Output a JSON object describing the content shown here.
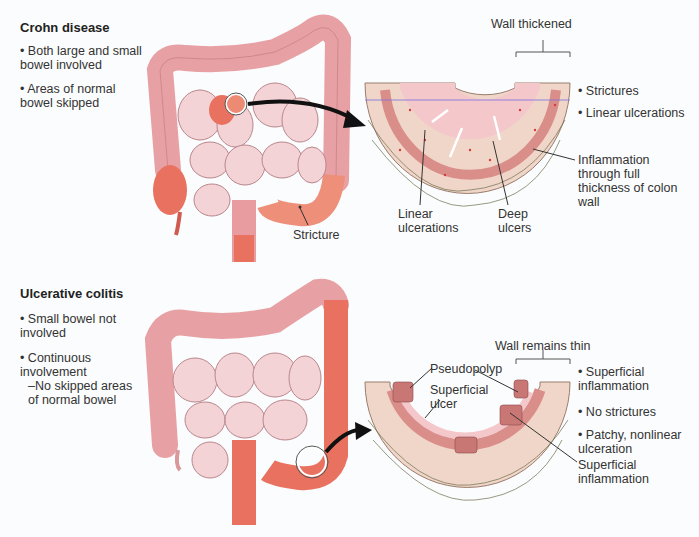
{
  "crohn": {
    "title": "Crohn disease",
    "bullets": [
      "Both large and small bowel involved",
      "Areas of normal bowel skipped"
    ],
    "colon_label": "Stricture",
    "cross_section": {
      "top_label": "Wall thickened",
      "labels": {
        "linear_ulcerations": "Linear ulcerations",
        "deep_ulcers": "Deep ulcers",
        "inflammation": "Inflammation through full thickness of colon wall"
      },
      "features": [
        "Strictures",
        "Linear ulcerations"
      ]
    }
  },
  "uc": {
    "title": "Ulcerative colitis",
    "bullets": [
      "Small bowel not involved",
      "Continuous involvement",
      "–No skipped areas of normal bowel"
    ],
    "cross_section": {
      "top_label": "Wall remains thin",
      "labels": {
        "pseudopolyp": "Pseudopolyp",
        "superficial_ulcer": "Superficial ulcer",
        "superficial_inflammation": "Superficial inflammation"
      },
      "features": [
        "Superficial inflammation",
        "No strictures",
        "Patchy, nonlinear ulceration"
      ]
    }
  },
  "colors": {
    "colon_normal": "#e7a1a4",
    "colon_inflamed": "#e8725f",
    "small_bowel": "#f3d3d6",
    "wall_outer": "#f0d6c8",
    "mucosa": "#f4c7cb",
    "muscle_band": "#d98e8a"
  }
}
